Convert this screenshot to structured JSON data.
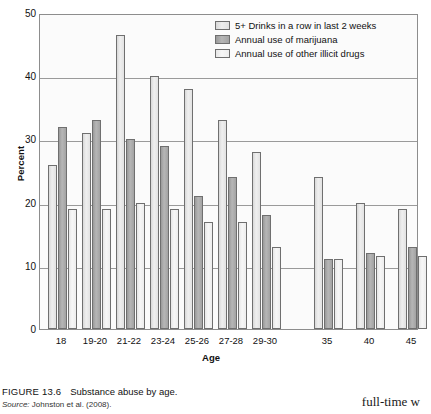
{
  "figure": {
    "label": "FIGURE 13.6",
    "title": "Substance abuse by age.",
    "source_label": "Source:",
    "source_text": "Johnston et al. (2008)."
  },
  "page_bleed_text": "full-time w",
  "chart_data": {
    "type": "bar",
    "title": "Substance abuse by age.",
    "xlabel": "Age",
    "ylabel": "Percent",
    "ylim": [
      0,
      50
    ],
    "yticks": [
      0,
      10,
      20,
      30,
      40,
      50
    ],
    "grid": true,
    "legend_position": "top-right",
    "categories": [
      "18",
      "19-20",
      "21-22",
      "23-24",
      "25-26",
      "27-28",
      "29-30",
      "35",
      "40",
      "45"
    ],
    "series": [
      {
        "name": "5+ Drinks in a row in last 2 weeks",
        "color": "#e2e2e2",
        "values": [
          26,
          31,
          46.5,
          40,
          38,
          33,
          28,
          24,
          20,
          19
        ]
      },
      {
        "name": "Annual use of marijuana",
        "color": "#a8a8a8",
        "values": [
          32,
          33,
          30,
          29,
          21,
          24,
          18,
          11,
          12,
          13
        ]
      },
      {
        "name": "Annual use of other illicit drugs",
        "color": "#efefef",
        "values": [
          19,
          19,
          20,
          19,
          17,
          17,
          13,
          11,
          11.5,
          11.5
        ]
      }
    ]
  }
}
